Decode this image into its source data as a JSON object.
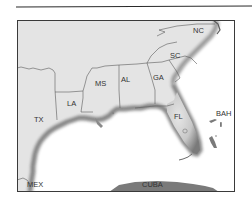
{
  "figure": {
    "type": "regional map",
    "region": "Southeastern United States and Gulf of Mexico"
  },
  "labels": {
    "tx": "TX",
    "la": "LA",
    "ms": "MS",
    "al": "AL",
    "ga": "GA",
    "sc": "SC",
    "nc": "NC",
    "fl": "FL",
    "bah": "BAH",
    "mex": "MEX",
    "cuba": "CUBA"
  },
  "colors": {
    "land": "#e4e4e4",
    "coast_shade": "#8a8a8a",
    "border": "#5a5a5a",
    "water": "#ffffff",
    "frame": "#3a3a3a",
    "islands": "#7a7a7a"
  }
}
